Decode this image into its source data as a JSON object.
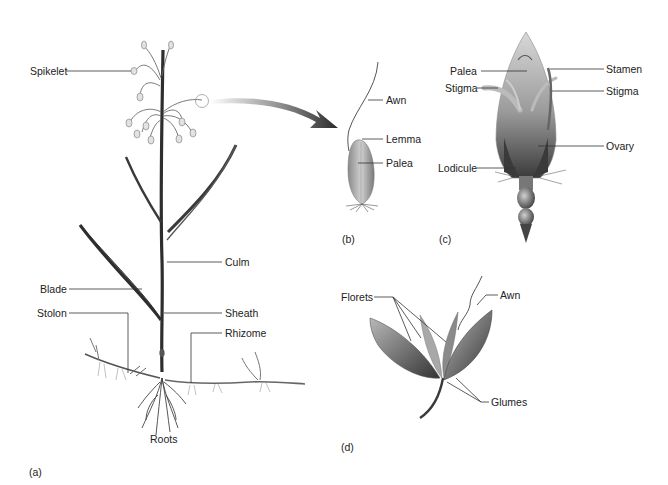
{
  "figure": {
    "panels": {
      "a": {
        "label": "(a)",
        "title": "Grass plant"
      },
      "b": {
        "label": "(b)",
        "title": "Floret"
      },
      "c": {
        "label": "(c)",
        "title": "Flower"
      },
      "d": {
        "label": "(d)",
        "title": "Spikelet"
      }
    },
    "labels_a": {
      "spikelet": "Spikelet",
      "culm": "Culm",
      "blade": "Blade",
      "stolon": "Stolon",
      "sheath": "Sheath",
      "rhizome": "Rhizome",
      "roots": "Roots"
    },
    "labels_b": {
      "awn": "Awn",
      "lemma": "Lemma",
      "palea": "Palea"
    },
    "labels_c": {
      "palea": "Palea",
      "stamen": "Stamen",
      "stigma_left": "Stigma",
      "stigma_right": "Stigma",
      "ovary": "Ovary",
      "lodicule": "Lodicule"
    },
    "labels_d": {
      "florets": "Florets",
      "awn": "Awn",
      "glumes": "Glumes"
    },
    "colors": {
      "line": "#333333",
      "dark": "#3a3a3a",
      "mid": "#7a7a7a",
      "light": "#c8c8c8"
    }
  }
}
